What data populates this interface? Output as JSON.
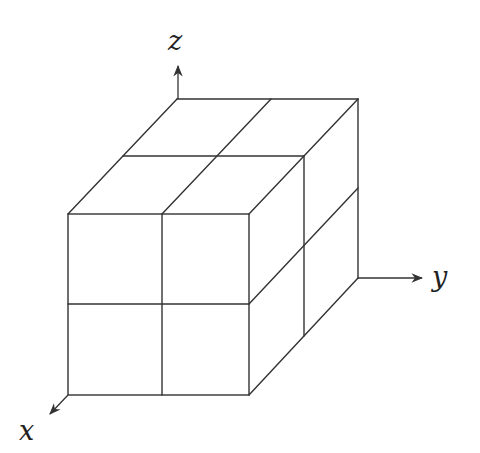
{
  "diagram": {
    "title": "",
    "stroke_color": "#333333",
    "background": "#ffffff",
    "axes": {
      "x": {
        "label": "x"
      },
      "y": {
        "label": "y"
      },
      "z": {
        "label": "z"
      }
    },
    "cube": {
      "subdivisions": [
        2,
        2,
        2
      ]
    }
  }
}
